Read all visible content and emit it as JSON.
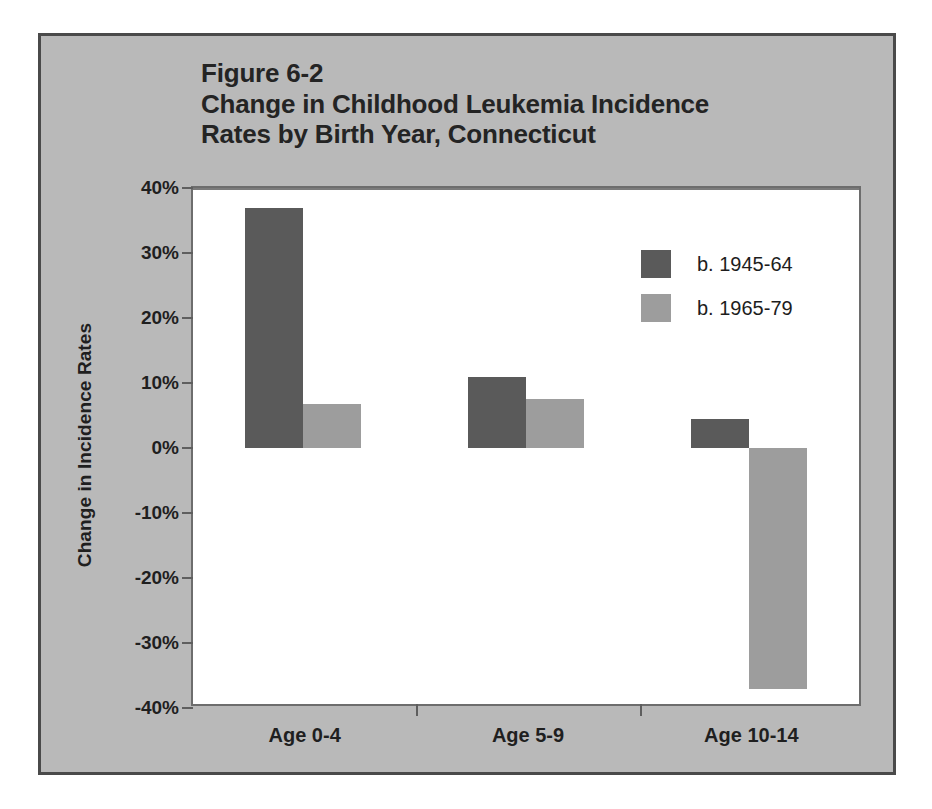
{
  "figure": {
    "number": "Figure 6-2",
    "title_line_1": "Change in Childhood Leukemia Incidence",
    "title_line_2": "Rates by Birth Year, Connecticut"
  },
  "colors": {
    "series_1945_64": "#5a5a5a",
    "series_1965_79": "#9d9d9d",
    "panel_background": "#b9b9b9",
    "plot_background": "#ffffff",
    "axis": "#6d6d6d",
    "text": "#1f1f1f"
  },
  "chart_data": {
    "type": "bar",
    "title": "Figure 6-2 Change in Childhood Leukemia Incidence Rates by Birth Year, Connecticut",
    "xlabel": "",
    "ylabel": "Change in Incidence Rates",
    "categories": [
      "Age 0-4",
      "Age 5-9",
      "Age 10-14"
    ],
    "series": [
      {
        "name": "b. 1945-64",
        "color": "#5a5a5a",
        "values": [
          37,
          11,
          4.5
        ]
      },
      {
        "name": "b. 1965-79",
        "color": "#9d9d9d",
        "values": [
          6.8,
          7.5,
          -37
        ]
      }
    ],
    "ylim": [
      -40,
      40
    ],
    "ytick_values": [
      40,
      30,
      20,
      10,
      0,
      -10,
      -20,
      -30,
      -40
    ],
    "ytick_labels": [
      "40%",
      "30%",
      "20%",
      "10%",
      "0%",
      "-10%",
      "-20%",
      "-30%",
      "-40%"
    ],
    "grid": false,
    "legend_position": "upper right",
    "value_unit": "percent"
  }
}
